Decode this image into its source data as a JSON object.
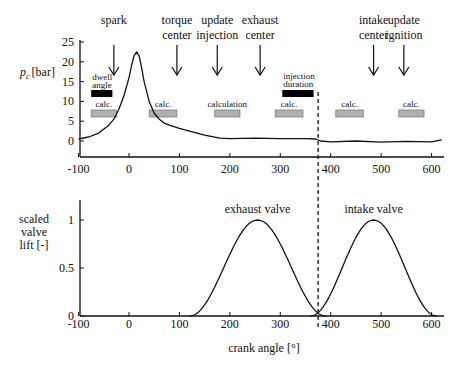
{
  "chart_data": [
    {
      "type": "line",
      "title": "",
      "xlabel": "",
      "ylabel": "p_c [bar]",
      "ylabel_main": "p",
      "ylabel_sub": "c",
      "ylabel_unit": "[bar]",
      "xlim": [
        -100,
        620
      ],
      "ylim": [
        -3,
        25
      ],
      "grid": false,
      "xticks": [
        -100,
        0,
        100,
        200,
        300,
        400,
        500,
        600
      ],
      "xtick_labels": [
        "-100",
        "0",
        "100",
        "200",
        "300",
        "400",
        "500",
        "600"
      ],
      "yticks": [
        0,
        5,
        10,
        15,
        20,
        25
      ],
      "ytick_labels": [
        "0",
        "5",
        "10",
        "15",
        "20",
        "25"
      ],
      "series": [
        {
          "name": "cylinder pressure",
          "x": [
            -100,
            -80,
            -60,
            -40,
            -30,
            -20,
            -10,
            0,
            5,
            10,
            15,
            20,
            25,
            30,
            40,
            50,
            60,
            70,
            80,
            100,
            120,
            150,
            180,
            200,
            250,
            300,
            350,
            370,
            380,
            400,
            450,
            500,
            550,
            600,
            620
          ],
          "values": [
            0.5,
            1.0,
            2.0,
            4.0,
            5.5,
            8.0,
            11.5,
            16.0,
            19.0,
            21.5,
            22.5,
            21.5,
            18.5,
            15.0,
            10.0,
            7.0,
            5.5,
            4.5,
            4.0,
            3.2,
            2.5,
            1.5,
            0.7,
            0.6,
            0.7,
            0.6,
            0.6,
            0.5,
            0.0,
            -0.2,
            0.0,
            -0.3,
            -0.1,
            -0.2,
            0.3
          ]
        }
      ],
      "events": [
        {
          "label_lines": [
            "spark"
          ],
          "x": -30
        },
        {
          "label_lines": [
            "torque",
            "center"
          ],
          "x": 95
        },
        {
          "label_lines": [
            "update",
            "injection"
          ],
          "x": 175
        },
        {
          "label_lines": [
            "exhaust",
            "center"
          ],
          "x": 260
        },
        {
          "label_lines": [
            "intake",
            "center"
          ],
          "x": 485
        },
        {
          "label_lines": [
            "update",
            "ignition"
          ],
          "x": 545
        }
      ],
      "bars": [
        {
          "label_lines": [
            "dwell",
            "angle"
          ],
          "x_start": -75,
          "x_end": -33,
          "y": 12,
          "color": "#000000"
        },
        {
          "label_lines": [
            "injection",
            "duration"
          ],
          "x_start": 300,
          "x_end": 370,
          "y": 15,
          "color": "#000000"
        }
      ],
      "calc_blocks": [
        {
          "label": "calc.",
          "x_start": -75,
          "x_end": -25,
          "y": 7
        },
        {
          "label": "calc.",
          "x_start": 40,
          "x_end": 95,
          "y": 7
        },
        {
          "label": "calculation",
          "x_start": 170,
          "x_end": 220,
          "y": 7
        },
        {
          "label": "calc.",
          "x_start": 290,
          "x_end": 345,
          "y": 7
        },
        {
          "label": "calc.",
          "x_start": 410,
          "x_end": 465,
          "y": 7
        },
        {
          "label": "calc.",
          "x_start": 535,
          "x_end": 585,
          "y": 7
        }
      ],
      "vline": {
        "x": 375,
        "style": "dashed"
      }
    },
    {
      "type": "line",
      "title": "",
      "xlabel": "crank angle [°]",
      "ylabel": "scaled valve lift [-]",
      "ylabel_lines": [
        "scaled",
        "valve",
        "lift [-]"
      ],
      "xlim": [
        -100,
        620
      ],
      "ylim": [
        0,
        1.2
      ],
      "grid": false,
      "xticks": [
        -100,
        0,
        100,
        200,
        300,
        400,
        500,
        600
      ],
      "xtick_labels": [
        "-100",
        "0",
        "100",
        "200",
        "300",
        "400",
        "500",
        "600"
      ],
      "yticks": [
        0,
        0.5,
        1
      ],
      "ytick_labels": [
        "0",
        "0.5",
        "1"
      ],
      "series": [
        {
          "name": "exhaust valve",
          "x_start": 120,
          "x_peak": 255,
          "x_end": 390,
          "peak": 1.0
        },
        {
          "name": "intake valve",
          "x_start": 360,
          "x_peak": 485,
          "x_end": 610,
          "peak": 1.0
        }
      ],
      "annotations": [
        {
          "text": "exhaust valve",
          "x": 255,
          "y": 1.1
        },
        {
          "text": "intake valve",
          "x": 485,
          "y": 1.1
        }
      ],
      "vline": {
        "x": 375,
        "style": "dashed"
      }
    }
  ]
}
